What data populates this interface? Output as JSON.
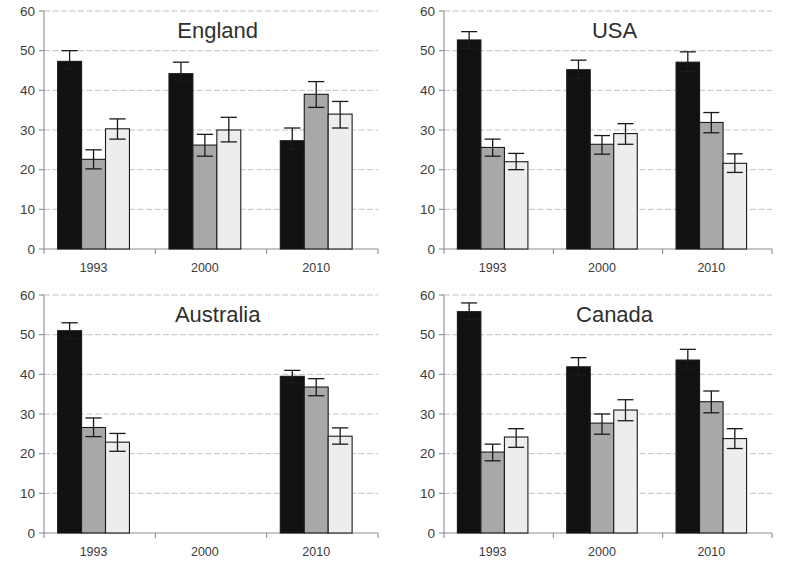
{
  "figure": {
    "panel_order": [
      "england",
      "usa",
      "australia",
      "canada"
    ],
    "y_axis": {
      "min": 0,
      "max": 60,
      "ticks": [
        0,
        10,
        20,
        30,
        40,
        50,
        60
      ],
      "tick_labels": [
        "0",
        "10",
        "20",
        "30",
        "40",
        "50",
        "60"
      ]
    },
    "x_axis": {
      "categories": [
        "1993",
        "2000",
        "2010"
      ]
    },
    "series_colors": {
      "series1": "#111111",
      "series2": "#a8a8a8",
      "series3": "#ededed"
    },
    "styling": {
      "gridline_color": "#b9b9b9",
      "axis_color": "#8c8c8c",
      "bar_outline_color": "#1a1a1a",
      "text_color": "#3b3b3b",
      "background": "#ffffff"
    }
  },
  "chart_data": [
    {
      "type": "bar",
      "title": "England",
      "xlabel": "",
      "ylabel": "",
      "ylim": [
        0,
        60
      ],
      "yticks": [
        0,
        10,
        20,
        30,
        40,
        50,
        60
      ],
      "grid": true,
      "legend": "none",
      "categories": [
        "1993",
        "2000",
        "2010"
      ],
      "series": [
        {
          "name": "series1",
          "color": "#111111",
          "values": [
            47.3,
            44.2,
            27.3
          ],
          "errors_low": [
            45.4,
            42.2,
            25.2
          ],
          "errors_high": [
            50.0,
            47.1,
            30.5
          ]
        },
        {
          "name": "series2",
          "color": "#a8a8a8",
          "values": [
            22.6,
            26.2,
            39.0
          ],
          "errors_low": [
            20.2,
            23.4,
            35.7
          ],
          "errors_high": [
            25.0,
            28.9,
            42.2
          ]
        },
        {
          "name": "series3",
          "color": "#ededed",
          "values": [
            30.3,
            30.0,
            34.0
          ],
          "errors_low": [
            27.7,
            27.0,
            30.5
          ],
          "errors_high": [
            32.8,
            33.2,
            37.2
          ]
        }
      ]
    },
    {
      "type": "bar",
      "title": "USA",
      "xlabel": "",
      "ylabel": "",
      "ylim": [
        0,
        60
      ],
      "yticks": [
        0,
        10,
        20,
        30,
        40,
        50,
        60
      ],
      "grid": true,
      "legend": "none",
      "categories": [
        "1993",
        "2000",
        "2010"
      ],
      "series": [
        {
          "name": "series1",
          "color": "#111111",
          "values": [
            52.7,
            45.2,
            47.1
          ],
          "errors_low": [
            50.6,
            43.0,
            44.8
          ],
          "errors_high": [
            54.8,
            47.6,
            49.7
          ]
        },
        {
          "name": "series2",
          "color": "#a8a8a8",
          "values": [
            25.6,
            26.4,
            31.9
          ],
          "errors_low": [
            23.4,
            23.9,
            29.3
          ],
          "errors_high": [
            27.7,
            28.6,
            34.4
          ]
        },
        {
          "name": "series3",
          "color": "#ededed",
          "values": [
            22.0,
            29.1,
            21.6
          ],
          "errors_low": [
            20.0,
            26.4,
            19.3
          ],
          "errors_high": [
            24.1,
            31.6,
            24.0
          ]
        }
      ]
    },
    {
      "type": "bar",
      "title": "Australia",
      "xlabel": "",
      "ylabel": "",
      "ylim": [
        0,
        60
      ],
      "yticks": [
        0,
        10,
        20,
        30,
        40,
        50,
        60
      ],
      "grid": true,
      "legend": "none",
      "categories": [
        "1993",
        "2000",
        "2010"
      ],
      "series": [
        {
          "name": "series1",
          "color": "#111111",
          "values": [
            51.0,
            null,
            39.5
          ],
          "errors_low": [
            49.0,
            null,
            37.9
          ],
          "errors_high": [
            53.0,
            null,
            41.0
          ]
        },
        {
          "name": "series2",
          "color": "#a8a8a8",
          "values": [
            26.6,
            null,
            36.8
          ],
          "errors_low": [
            24.3,
            null,
            34.6
          ],
          "errors_high": [
            29.0,
            null,
            38.9
          ]
        },
        {
          "name": "series3",
          "color": "#ededed",
          "values": [
            22.9,
            null,
            24.4
          ],
          "errors_low": [
            20.6,
            null,
            22.4
          ],
          "errors_high": [
            25.1,
            null,
            26.5
          ]
        }
      ]
    },
    {
      "type": "bar",
      "title": "Canada",
      "xlabel": "",
      "ylabel": "",
      "ylim": [
        0,
        60
      ],
      "yticks": [
        0,
        10,
        20,
        30,
        40,
        50,
        60
      ],
      "grid": true,
      "legend": "none",
      "categories": [
        "1993",
        "2000",
        "2010"
      ],
      "series": [
        {
          "name": "series1",
          "color": "#111111",
          "values": [
            55.8,
            41.9,
            43.6
          ],
          "errors_low": [
            53.8,
            39.8,
            41.2
          ],
          "errors_high": [
            58.0,
            44.2,
            46.3
          ]
        },
        {
          "name": "series2",
          "color": "#a8a8a8",
          "values": [
            20.4,
            27.7,
            33.1
          ],
          "errors_low": [
            18.2,
            24.9,
            30.3
          ],
          "errors_high": [
            22.4,
            30.0,
            35.8
          ]
        },
        {
          "name": "series3",
          "color": "#ededed",
          "values": [
            24.2,
            31.0,
            23.8
          ],
          "errors_low": [
            21.6,
            28.3,
            21.3
          ],
          "errors_high": [
            26.3,
            33.6,
            26.3
          ]
        }
      ]
    }
  ]
}
